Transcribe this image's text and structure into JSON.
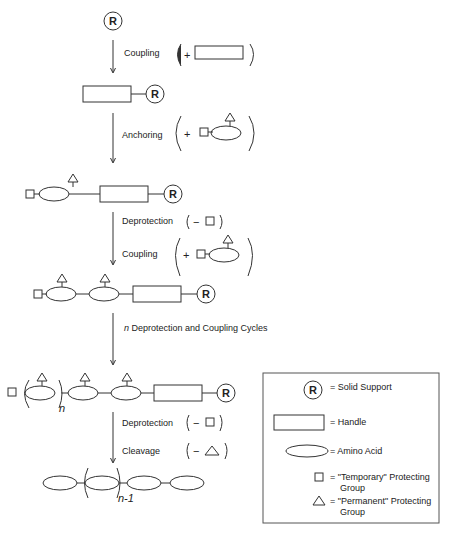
{
  "diagram": {
    "support_symbol": "R",
    "steps": [
      {
        "label": "Coupling",
        "reagent_sign": "+",
        "reagent": "handle"
      },
      {
        "label": "Anchoring",
        "reagent_sign": "+",
        "reagent": "protected amino acid"
      },
      {
        "label": "Deprotection",
        "reagent_sign": "−",
        "reagent": "temporary protecting group"
      },
      {
        "label": "Coupling",
        "reagent_sign": "+",
        "reagent": "protected amino acid"
      },
      {
        "label_prefix": "n",
        "label": " Deprotection and Coupling Cycles"
      },
      {
        "label": "Deprotection",
        "reagent_sign": "−",
        "reagent": "temporary protecting group"
      },
      {
        "label": "Cleavage",
        "reagent_sign": "−",
        "reagent": "permanent protecting group"
      }
    ],
    "subscripts": {
      "repeat_n": "n",
      "product_n": "n-1"
    }
  },
  "legend": {
    "items": [
      {
        "icon": "solid-support-icon",
        "text": "= Solid Support"
      },
      {
        "icon": "handle-icon",
        "text": "= Handle"
      },
      {
        "icon": "amino-acid-icon",
        "text": "= Amino Acid"
      },
      {
        "icon": "square-icon",
        "text_line1": "= \"Temporary\" Protecting",
        "text_line2": "Group"
      },
      {
        "icon": "triangle-icon",
        "text_line1": "= \"Permanent\" Protecting",
        "text_line2": "Group"
      }
    ]
  }
}
